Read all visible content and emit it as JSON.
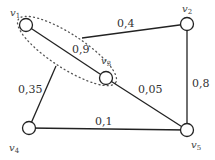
{
  "graph": {
    "nodes": [
      {
        "id": "v1",
        "label": "v",
        "sub": "1",
        "x": 26,
        "y": 25
      },
      {
        "id": "v2",
        "label": "v",
        "sub": "2",
        "x": 187,
        "y": 24
      },
      {
        "id": "v3",
        "label": "v",
        "sub": "3",
        "x": 106,
        "y": 78
      },
      {
        "id": "v4",
        "label": "v",
        "sub": "4",
        "x": 29,
        "y": 128
      },
      {
        "id": "v5",
        "label": "v",
        "sub": "5",
        "x": 187,
        "y": 130
      }
    ],
    "edges": [
      {
        "from": "v1",
        "to": "v3",
        "weight": "0,9"
      },
      {
        "from": "cluster",
        "to": "v2",
        "weight": "0,4"
      },
      {
        "from": "v2",
        "to": "v5",
        "weight": "0,8"
      },
      {
        "from": "v3",
        "to": "v5",
        "weight": "0,05"
      },
      {
        "from": "v4",
        "to": "cluster",
        "weight": "0,35"
      },
      {
        "from": "v4",
        "to": "v5",
        "weight": "0,1"
      }
    ],
    "cluster": {
      "members": [
        "v1",
        "v3"
      ],
      "style": "dotted"
    }
  },
  "labels": {
    "e13": "0,9",
    "e_c2": "0,4",
    "e25": "0,8",
    "e35": "0,05",
    "e4c": "0,35",
    "e45": "0,1",
    "v1": "v",
    "v1s": "1",
    "v2": "v",
    "v2s": "2",
    "v3": "v",
    "v3s": "3",
    "v4": "v",
    "v4s": "4",
    "v5": "v",
    "v5s": "5"
  }
}
